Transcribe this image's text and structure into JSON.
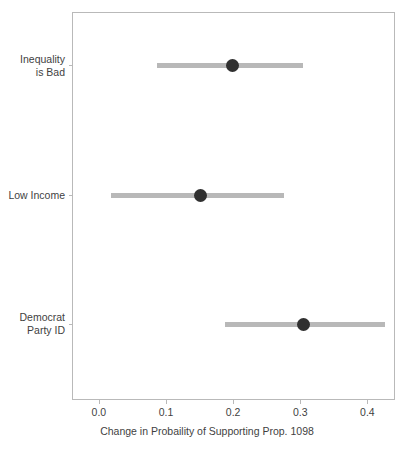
{
  "chart_data": {
    "type": "scatter",
    "title": "",
    "xlabel": "Change in Probaility of Supporting Prop. 1098",
    "ylabel": "",
    "xlim": [
      -0.04,
      0.4412
    ],
    "grid": false,
    "legend": null,
    "xticks": [
      {
        "value": 0.0,
        "label": "0.0"
      },
      {
        "value": 0.1,
        "label": "0.1"
      },
      {
        "value": 0.2,
        "label": "0.2"
      },
      {
        "value": 0.3,
        "label": "0.3"
      },
      {
        "value": 0.4,
        "label": "0.4"
      }
    ],
    "categories": [
      "Inequality\nis Bad",
      "Low Income",
      "Democrat\nParty ID"
    ],
    "points": [
      {
        "label_line1": "Inequality",
        "label_line2": "is Bad",
        "estimate": 0.197,
        "ci_low": 0.085,
        "ci_high": 0.303
      },
      {
        "label_line1": "Low Income",
        "label_line2": "",
        "estimate": 0.15,
        "ci_low": 0.016,
        "ci_high": 0.274
      },
      {
        "label_line1": "Democrat",
        "label_line2": "Party ID",
        "estimate": 0.304,
        "ci_low": 0.187,
        "ci_high": 0.425
      }
    ],
    "colors": {
      "dot": "#303030",
      "interval": "#b8b8b8",
      "frame": "#b9b9b9",
      "text": "#3f3f3f",
      "background": "#ffffff"
    }
  }
}
